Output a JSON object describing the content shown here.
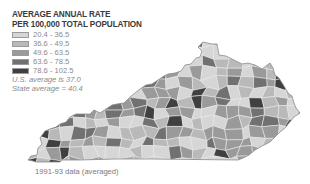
{
  "legend": {
    "title_line1": "AVERAGE ANNUAL RATE",
    "title_line2": "PER 100,000 TOTAL POPULATION",
    "classes": [
      {
        "label": "20.4 - 36.5",
        "color": "#d6d6d6"
      },
      {
        "label": "36.6 - 49.5",
        "color": "#b9b9b9"
      },
      {
        "label": "49.6 - 63.5",
        "color": "#9a9a9a"
      },
      {
        "label": "63.6 - 78.5",
        "color": "#717171"
      },
      {
        "label": "78.6 - 102.5",
        "color": "#404040"
      }
    ],
    "us_average": "U.S. average is 37.0",
    "state_average": "State average = 40.4"
  },
  "map": {
    "region": "Kentucky counties",
    "border_color": "#e8e8e8",
    "outline_color": "#8c8c8c"
  },
  "source_note": "1991-93 data (averaged)"
}
